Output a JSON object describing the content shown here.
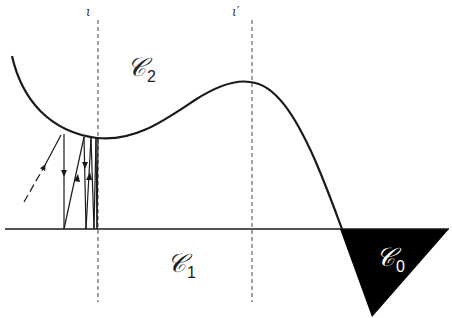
{
  "diagram": {
    "labels": {
      "iota": "ι",
      "iota_prime": "ι′",
      "c2_main": "𝒞",
      "c2_sub": "2",
      "c1_main": "𝒞",
      "c1_sub": "1",
      "c0_main": "𝒞",
      "c0_sub": "0"
    },
    "colors": {
      "stroke": "#1a1a1a",
      "region_c0_fill": "#000000",
      "region_c0_label": "#ffffff",
      "background": "#ffffff"
    },
    "elements": {
      "boundary_curve": "curve separating region C2 (above) from region C1 (below), with a local minimum near line ι and a local maximum near line ι′",
      "baseline": "horizontal line bounding region C1",
      "dashed_lines": [
        "ι",
        "ι′"
      ],
      "trajectory": "zig-zag trajectory with arrows bouncing between the curve and the baseline, accumulating at line ι",
      "region_c0": "black filled triangle to the lower right"
    }
  }
}
